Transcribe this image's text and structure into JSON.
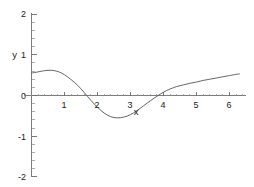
{
  "chart_data": {
    "type": "line",
    "title": "",
    "subtitle": "",
    "xlabel": "x",
    "ylabel": "y",
    "xlim": [
      -0.25,
      6.45
    ],
    "ylim": [
      -2,
      2
    ],
    "grid": false,
    "legend": false,
    "legend_position": "none",
    "xticks": [
      1,
      2,
      3,
      4,
      5,
      6
    ],
    "xtick_labels": [
      "1",
      "2",
      "3",
      "4",
      "5",
      "6"
    ],
    "yticks": [
      -2,
      -1,
      0,
      1,
      2
    ],
    "ytick_labels": [
      "-2",
      "-1",
      "0",
      "1",
      "2"
    ],
    "x_minor_tick_step": 0.2,
    "y_minor_tick_step": 0.2,
    "axis_position": "zero-crossing",
    "series": [
      {
        "name": "curve",
        "color": "#5d5d5d",
        "x": [
          0.0,
          0.2,
          0.4,
          0.6,
          0.8,
          1.0,
          1.2,
          1.4,
          1.6,
          1.8,
          2.0,
          2.2,
          2.4,
          2.6,
          2.8,
          3.0,
          3.2,
          3.4,
          3.6,
          3.8,
          4.0,
          4.2,
          4.4,
          4.6,
          4.8,
          5.0,
          5.2,
          5.4,
          5.6,
          5.8,
          6.0,
          6.2,
          6.3
        ],
        "y": [
          0.55,
          0.58,
          0.61,
          0.62,
          0.59,
          0.51,
          0.39,
          0.25,
          0.07,
          -0.12,
          -0.29,
          -0.43,
          -0.52,
          -0.55,
          -0.53,
          -0.47,
          -0.37,
          -0.25,
          -0.13,
          -0.02,
          0.08,
          0.16,
          0.22,
          0.26,
          0.3,
          0.33,
          0.37,
          0.4,
          0.43,
          0.46,
          0.49,
          0.52,
          0.53
        ]
      }
    ],
    "annotations": []
  },
  "axis_labels": {
    "y_title": "y",
    "x_title": "x",
    "y_tick_top": "2",
    "y_tick_one": "1",
    "y_tick_zero": "0",
    "y_tick_neg_one": "-1",
    "y_tick_neg_two": "-2",
    "x_tick_1": "1",
    "x_tick_2": "2",
    "x_tick_3": "3",
    "x_tick_4": "4",
    "x_tick_5": "5",
    "x_tick_6": "6"
  },
  "colors": {
    "curve": "#5d5d5d",
    "axis": "#6e6e6e",
    "text": "#1a1a1a",
    "background": "#ffffff"
  }
}
